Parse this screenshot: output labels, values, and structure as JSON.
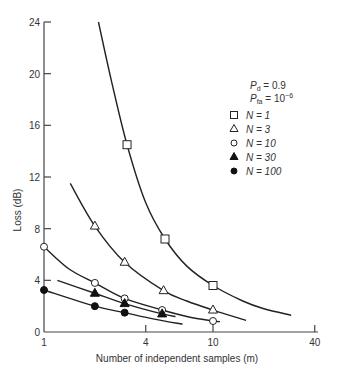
{
  "chart_data": {
    "type": "line",
    "title": "",
    "xlabel": "Number of independent samples (m)",
    "ylabel": "Loss (dB)",
    "xscale": "log",
    "xlim": [
      1,
      40
    ],
    "ylim": [
      0,
      24
    ],
    "x_ticks": [
      1,
      4,
      10,
      40
    ],
    "y_ticks": [
      0,
      4,
      8,
      12,
      16,
      20,
      24
    ],
    "grid": false,
    "annotations": {
      "pd": "P_d = 0.9",
      "pfa": "P_fa = 10^-6"
    },
    "legend_position": "upper right",
    "series": [
      {
        "name": "N = 1",
        "marker": "open-square",
        "curve": [
          [
            2.1,
            24.0
          ],
          [
            2.5,
            19.5
          ],
          [
            3.1,
            14.5
          ],
          [
            4.0,
            10.0
          ],
          [
            5.2,
            7.2
          ],
          [
            7.0,
            5.1
          ],
          [
            10.0,
            3.6
          ],
          [
            15.0,
            2.4
          ],
          [
            20.0,
            1.8
          ],
          [
            29.0,
            1.3
          ]
        ],
        "points": [
          [
            3.1,
            14.5
          ],
          [
            5.2,
            7.2
          ],
          [
            10.0,
            3.6
          ]
        ]
      },
      {
        "name": "N = 3",
        "marker": "open-triangle",
        "curve": [
          [
            1.43,
            11.5
          ],
          [
            2.0,
            8.2
          ],
          [
            3.0,
            5.4
          ],
          [
            5.1,
            3.2
          ],
          [
            7.0,
            2.4
          ],
          [
            10.0,
            1.7
          ],
          [
            15.7,
            0.9
          ]
        ],
        "points": [
          [
            2.0,
            8.2
          ],
          [
            3.0,
            5.4
          ],
          [
            5.1,
            3.2
          ],
          [
            10.0,
            1.7
          ]
        ]
      },
      {
        "name": "N = 10",
        "marker": "open-circle",
        "curve": [
          [
            1.0,
            6.6
          ],
          [
            1.4,
            4.9
          ],
          [
            2.0,
            3.8
          ],
          [
            3.0,
            2.6
          ],
          [
            5.0,
            1.7
          ],
          [
            7.0,
            1.2
          ],
          [
            10.0,
            0.85
          ],
          [
            11.0,
            0.8
          ]
        ],
        "points": [
          [
            1.0,
            6.6
          ],
          [
            2.0,
            3.8
          ],
          [
            3.0,
            2.6
          ],
          [
            5.0,
            1.7
          ],
          [
            10.0,
            0.85
          ]
        ]
      },
      {
        "name": "N = 30",
        "marker": "filled-triangle",
        "curve": [
          [
            1.2,
            4.0
          ],
          [
            2.0,
            3.0
          ],
          [
            3.0,
            2.2
          ],
          [
            5.0,
            1.4
          ],
          [
            6.0,
            1.2
          ]
        ],
        "points": [
          [
            2.0,
            3.0
          ],
          [
            3.0,
            2.2
          ],
          [
            5.0,
            1.4
          ]
        ]
      },
      {
        "name": "N = 100",
        "marker": "filled-circle",
        "curve": [
          [
            1.0,
            3.25
          ],
          [
            2.0,
            2.0
          ],
          [
            3.0,
            1.5
          ],
          [
            4.5,
            1.0
          ],
          [
            6.6,
            0.6
          ]
        ],
        "points": [
          [
            1.0,
            3.25
          ],
          [
            2.0,
            2.0
          ],
          [
            3.0,
            1.5
          ]
        ]
      }
    ]
  },
  "labels": {
    "ylabel": "Loss (dB)",
    "xlabel": "Number of independent samples (m)",
    "y_ticks": [
      "0",
      "4",
      "8",
      "12",
      "16",
      "20",
      "24"
    ],
    "x_ticks": [
      "1",
      "4",
      "10",
      "40"
    ],
    "pd_main": "P",
    "pd_sub": "d",
    "pd_value": " = 0.9",
    "pfa_main": "P",
    "pfa_sub": "fa",
    "pfa_value": " = 10",
    "pfa_exp": "−6",
    "legend": [
      "N = 1",
      "N = 3",
      "N = 10",
      "N = 30",
      "N = 100"
    ]
  },
  "colors": {
    "line": "#222222",
    "axis": "#444444",
    "background": "#ffffff"
  }
}
